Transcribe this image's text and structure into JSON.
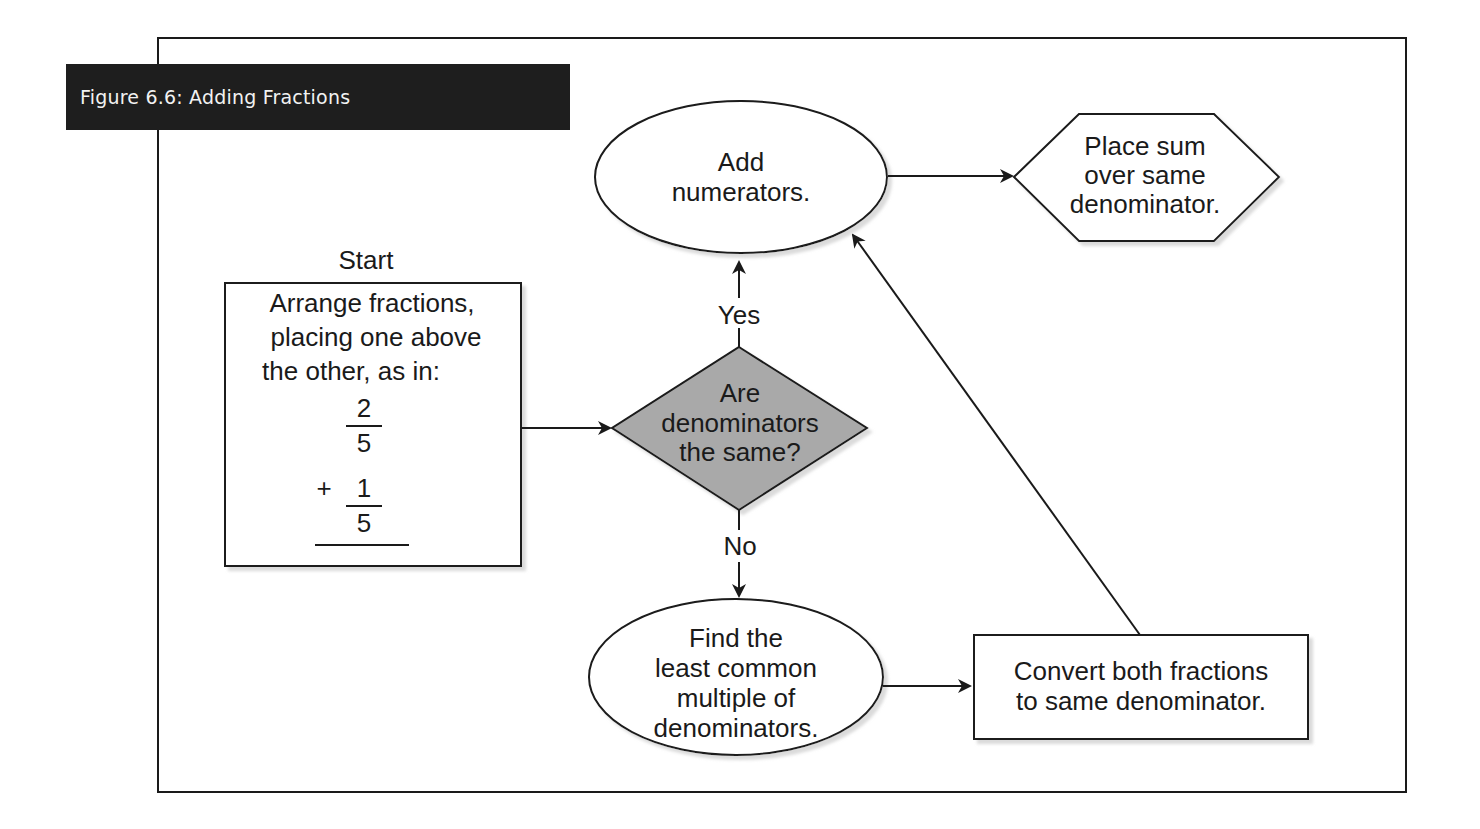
{
  "figure": {
    "title": "Figure 6.6: Adding Fractions"
  },
  "nodes": {
    "start_label": "Start",
    "arrange": {
      "lines": [
        "Arrange fractions,",
        "placing one above",
        "the other, as in:"
      ],
      "fraction1": {
        "numerator": "2",
        "denominator": "5"
      },
      "operator": "+",
      "fraction2": {
        "numerator": "1",
        "denominator": "5"
      }
    },
    "decision": {
      "lines": [
        "Are",
        "denominators",
        "the same?"
      ],
      "yes_label": "Yes",
      "no_label": "No"
    },
    "add_numerators": {
      "lines": [
        "Add",
        "numerators."
      ]
    },
    "place_sum": {
      "lines": [
        "Place sum",
        "over same",
        "denominator."
      ]
    },
    "find_lcm": {
      "lines": [
        "Find the",
        "least common",
        "multiple of",
        "denominators."
      ]
    },
    "convert": {
      "lines": [
        "Convert both fractions",
        "to same denominator."
      ]
    }
  },
  "colors": {
    "decision_fill": "#a9a9a9",
    "title_bg": "#1e1e1e",
    "stroke": "#1a1a1a"
  }
}
